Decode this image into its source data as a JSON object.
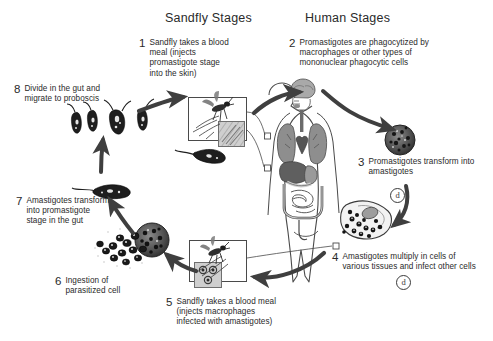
{
  "diagram": {
    "background_color": "#ffffff",
    "ink_color": "#231f20",
    "arrow_color": "#3f3f3f"
  },
  "headers": {
    "sandfly": "Sandfly Stages",
    "human": "Human Stages"
  },
  "steps": [
    {
      "num": "1",
      "text": "Sandfly takes a blood meal (injects promastigote stage into the skin)",
      "side": "sandfly",
      "marker": null
    },
    {
      "num": "2",
      "text": "Promastigotes are phagocytized by macrophages or other types of mononuclear phagocytic cells",
      "side": "human",
      "marker": null
    },
    {
      "num": "3",
      "text": "Promastigotes transform into amastigotes",
      "side": "human",
      "marker": "d"
    },
    {
      "num": "4",
      "text": "Amastigotes multiply in cells of various tissues and infect other cells",
      "side": "human",
      "marker": "d"
    },
    {
      "num": "5",
      "text": "Sandfly takes a blood meal (injects macrophages infected with amastigotes)",
      "side": "sandfly",
      "marker": null
    },
    {
      "num": "6",
      "text": "Ingestion of parasitized cell",
      "side": "sandfly",
      "marker": null
    },
    {
      "num": "7",
      "text": "Amastigotes transform into promastigote stage in the gut",
      "side": "sandfly",
      "marker": null
    },
    {
      "num": "8",
      "text": "Divide in the gut and migrate to proboscis",
      "side": "sandfly",
      "marker": null
    }
  ],
  "markers": {
    "d_label": "d"
  },
  "illustrations": {
    "sandfly_bite_top": "sandfly-biting-skin-illustration",
    "sandfly_bite_bottom": "sandfly-biting-skin-illustration",
    "promastigote_inset_top": "promastigote-microscopy-inset",
    "amastigote_inset_bottom": "amastigote-microscopy-inset",
    "human_body": "human-body-with-internal-organs",
    "infected_macrophage": "infected-macrophage-cell",
    "amastigote_filled_cell": "amastigote-filled-tissue-cell",
    "parasitized_cell_cluster": "parasitized-cell-with-amastigotes",
    "single_promastigote": "single-promastigote-parasite",
    "dividing_promastigotes": "dividing-promastigotes-group",
    "promastigote_under_panel": "promastigote-parasite"
  }
}
